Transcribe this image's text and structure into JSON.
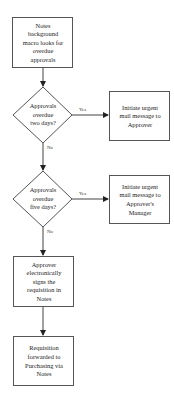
{
  "diagram": {
    "type": "flowchart",
    "nodes": {
      "start": {
        "shape": "rectangle",
        "text": "Notes\nbackground\nmacro looks for\noverdue\napprovals"
      },
      "decision1": {
        "shape": "diamond",
        "text": "Approvals\noverdue\ntwo days?"
      },
      "action1": {
        "shape": "rectangle",
        "text": "Initiate urgent\nmail message to\nApprover"
      },
      "decision2": {
        "shape": "diamond",
        "text": "Approvals\noverdue\nfive days?"
      },
      "action2": {
        "shape": "rectangle",
        "text": "Initiate urgent\nmail message to\nApprover's\nManager"
      },
      "sign": {
        "shape": "rectangle",
        "text": "Approver\nelectronically\nsigns the\nrequisition in\nNotes"
      },
      "forward": {
        "shape": "rectangle",
        "text": "Requisition\nforwarded to\nPurchasing via\nNotes"
      }
    },
    "edges": {
      "start_to_decision1": {
        "from": "start",
        "to": "decision1",
        "label": ""
      },
      "decision1_yes": {
        "from": "decision1",
        "to": "action1",
        "label": "Yes"
      },
      "decision1_no": {
        "from": "decision1",
        "to": "decision2",
        "label": "No"
      },
      "decision2_yes": {
        "from": "decision2",
        "to": "action2",
        "label": "Yes"
      },
      "decision2_no": {
        "from": "decision2",
        "to": "sign",
        "label": "No"
      },
      "sign_to_forward": {
        "from": "sign",
        "to": "forward",
        "label": ""
      }
    },
    "colors": {
      "stroke": "#555555",
      "fill": "#ffffff",
      "text": "#222222"
    }
  }
}
